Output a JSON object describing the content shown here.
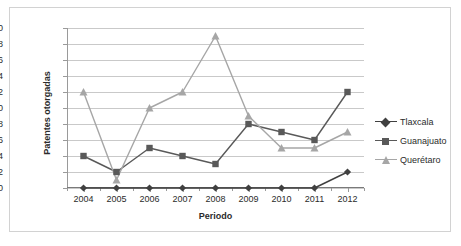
{
  "chart_data": {
    "type": "line",
    "title": "",
    "xlabel": "Periodo",
    "ylabel": "Patentes otorgadas",
    "categories": [
      "2004",
      "2005",
      "2006",
      "2007",
      "2008",
      "2009",
      "2010",
      "2011",
      "2012"
    ],
    "ylim": [
      0,
      20
    ],
    "ytick_step": 2,
    "yticks": [
      0,
      2,
      4,
      6,
      8,
      10,
      12,
      14,
      16,
      18,
      20
    ],
    "grid": true,
    "legend_position": "right",
    "series": [
      {
        "name": "Tlaxcala",
        "marker": "diamond",
        "color": "#404040",
        "values": [
          0,
          0,
          0,
          0,
          0,
          0,
          0,
          0,
          2
        ]
      },
      {
        "name": "Guanajuato",
        "marker": "square",
        "color": "#595959",
        "values": [
          4,
          2,
          5,
          4,
          3,
          8,
          7,
          6,
          12
        ]
      },
      {
        "name": "Querétaro",
        "marker": "triangle",
        "color": "#a6a6a6",
        "values": [
          12,
          1,
          10,
          12,
          19,
          9,
          5,
          5,
          7
        ]
      }
    ]
  },
  "style": {
    "background": "#ffffff",
    "frame_color": "#d2d2d2",
    "grid_color": "#c9c9c9",
    "axis_color": "#9a9a9a",
    "text_color": "#2b2b2b"
  }
}
